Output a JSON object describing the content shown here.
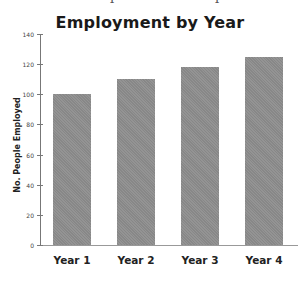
{
  "caption_clipped": "Example of a Bar Graph",
  "chart_data": {
    "type": "bar",
    "title": "Employment by Year",
    "xlabel": "",
    "ylabel": "No. People Employed",
    "categories": [
      "Year 1",
      "Year 2",
      "Year 3",
      "Year 4"
    ],
    "values": [
      100,
      110,
      118,
      125
    ],
    "ylim": [
      0,
      140
    ],
    "yticks": [
      0,
      20,
      40,
      60,
      80,
      100,
      120,
      140
    ],
    "grid": false,
    "legend": null,
    "bar_color": "#8d8d8d"
  }
}
